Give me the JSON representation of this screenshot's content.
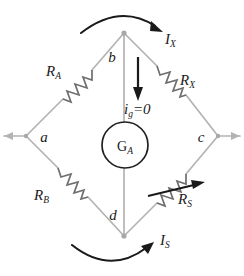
{
  "figure": {
    "background_color": "#ffffff",
    "wire_color": "#b0b0b0",
    "symbol_color": "#6e6e6e",
    "ink_color": "#1a1a1a",
    "width": 244,
    "height": 276
  },
  "nodes": [
    {
      "id": "b",
      "label": "b",
      "role": "top-node",
      "x": 124,
      "y": 33
    },
    {
      "id": "a",
      "label": "a",
      "role": "left-node",
      "x": 26,
      "y": 136
    },
    {
      "id": "c",
      "label": "c",
      "role": "right-node",
      "x": 218,
      "y": 136
    },
    {
      "id": "d",
      "label": "d",
      "role": "bottom-node",
      "x": 124,
      "y": 236
    }
  ],
  "components": [
    {
      "id": "RA",
      "name": "R",
      "subscript": "A",
      "type": "resistor",
      "branch": "a-b",
      "label_x": 55,
      "label_y": 72
    },
    {
      "id": "RX",
      "name": "R",
      "subscript": "X",
      "type": "resistor",
      "branch": "b-c",
      "label_x": 180,
      "label_y": 78
    },
    {
      "id": "RB",
      "name": "R",
      "subscript": "B",
      "type": "resistor",
      "branch": "a-d",
      "label_x": 42,
      "label_y": 196
    },
    {
      "id": "RS",
      "name": "R",
      "subscript": "S",
      "type": "variable-resistor",
      "branch": "d-c",
      "label_x": 185,
      "label_y": 199
    },
    {
      "id": "GA",
      "name": "G",
      "subscript": "A",
      "type": "galvanometer",
      "branch": "b-d",
      "cx": 125,
      "cy": 145,
      "r": 23
    }
  ],
  "currents": [
    {
      "id": "IX",
      "name": "I",
      "subscript": "X",
      "label_x": 168,
      "label_y": 42,
      "arc": "top",
      "direction": "left-to-right"
    },
    {
      "id": "IS",
      "name": "I",
      "subscript": "S",
      "label_x": 163,
      "label_y": 243,
      "arc": "bottom",
      "direction": "left-to-right"
    },
    {
      "id": "ig",
      "name": "i",
      "subscript": "g",
      "equals": "=0",
      "label_x": 131,
      "label_y": 113,
      "arrow": "down",
      "arrow_x": 138,
      "arrow_y_start": 59,
      "arrow_y_end": 98
    }
  ],
  "labels": {
    "node_b": "b",
    "node_a": "a",
    "node_c": "c",
    "node_d": "d",
    "galvanometer": "G",
    "galvanometer_sub": "A",
    "r_a": "R",
    "r_a_sub": "A",
    "r_x": "R",
    "r_x_sub": "X",
    "r_b": "R",
    "r_b_sub": "B",
    "r_s": "R",
    "r_s_sub": "S",
    "i_x": "I",
    "i_x_sub": "X",
    "i_s": "I",
    "i_s_sub": "S",
    "i_g": "i",
    "i_g_sub": "g",
    "i_g_value": "=0"
  }
}
